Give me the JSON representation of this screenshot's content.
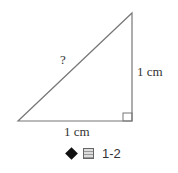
{
  "diagram": {
    "hypotenuse_label": "?",
    "vertical_side_label": "1 cm",
    "horizontal_side_label": "1 cm",
    "right_angle_marker": true
  },
  "caption": {
    "bullet_icon": "diamond-icon",
    "figure_icon": "figure-char-icon",
    "text": "1-2"
  }
}
